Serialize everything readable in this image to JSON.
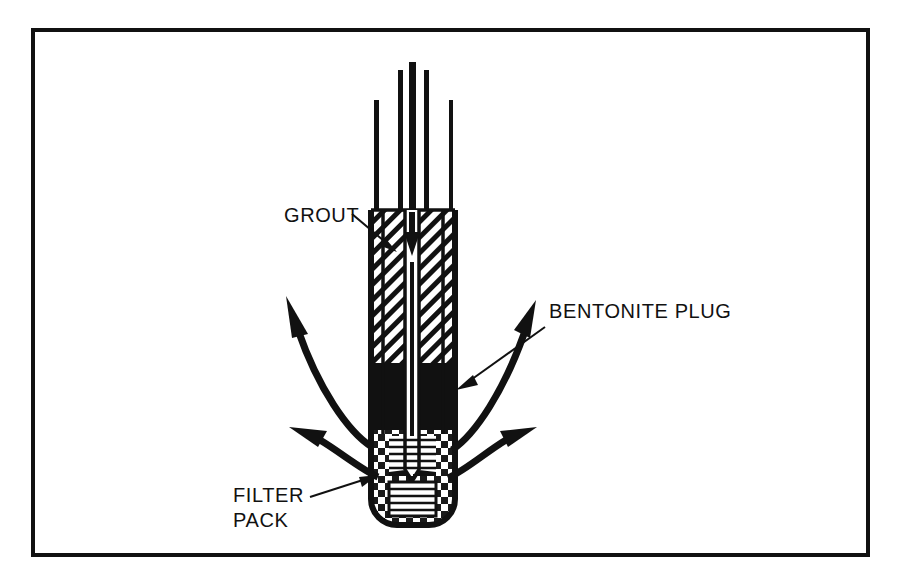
{
  "figure": {
    "type": "technical-cross-section-diagram",
    "background_color": "#ffffff",
    "ink_color": "#111111",
    "frame": {
      "name": "border-frame",
      "x": 33,
      "y": 30,
      "width": 835,
      "height": 525,
      "stroke_width": 4
    }
  },
  "labels": {
    "grout": {
      "text": "GROUT",
      "x": 284,
      "y": 222,
      "anchor": "start",
      "leader_from": [
        352,
        215
      ],
      "leader_to": [
        392,
        248
      ]
    },
    "bentonite": {
      "text": "BENTONITE PLUG",
      "x": 549,
      "y": 318,
      "anchor": "start",
      "leader_from": [
        545,
        327
      ],
      "leader_to": [
        457,
        388
      ]
    },
    "filter_pack_line1": {
      "text": "FILTER",
      "x": 233,
      "y": 502,
      "anchor": "start"
    },
    "filter_pack_line2": {
      "text": "PACK",
      "x": 233,
      "y": 527,
      "anchor": "start",
      "leader_from": [
        310,
        496
      ],
      "leader_to": [
        375,
        477
      ]
    }
  },
  "borehole": {
    "name": "borehole-assembly",
    "casing_left_outer": 371,
    "casing_right_outer": 455,
    "casing_left_inner": 381,
    "casing_right_inner": 445,
    "tube_left": 405,
    "tube_right": 419,
    "top_y": 62,
    "bottom_y": 525,
    "bottom_radius": 26,
    "standpipes": [
      {
        "name": "casing-wall-left",
        "x": 375,
        "top": 100,
        "width": 5
      },
      {
        "name": "riser-left",
        "x": 399,
        "top": 70,
        "width": 5
      },
      {
        "name": "tremie-tube-center",
        "x": 412,
        "top": 62,
        "width": 7
      },
      {
        "name": "riser-right",
        "x": 425,
        "top": 70,
        "width": 5
      },
      {
        "name": "casing-wall-right",
        "x": 450,
        "top": 100,
        "width": 4
      }
    ]
  },
  "zones": [
    {
      "name": "grout-zone",
      "material": "grout",
      "fill_pattern": "diagonal-hatch",
      "top": 210,
      "bottom": 363
    },
    {
      "name": "bentonite-zone",
      "material": "bentonite plug",
      "fill_pattern": "solid-black",
      "top": 363,
      "bottom": 432
    },
    {
      "name": "filter-pack-zone",
      "material": "filter pack",
      "fill_pattern": "checkerboard",
      "top": 432,
      "bottom": 525
    }
  ],
  "well_screen": {
    "name": "well-screen",
    "slot_count": 11,
    "top": 437,
    "bottom": 512
  },
  "flow": {
    "injection_arrow": {
      "name": "grout-injection-arrow",
      "direction": "down",
      "x": 412,
      "from_y": 212,
      "to_y": 252
    },
    "outflow_arrows": [
      {
        "name": "outflow-arrow-upper-left",
        "direction": "up-left"
      },
      {
        "name": "outflow-arrow-lower-left",
        "direction": "left"
      },
      {
        "name": "outflow-arrow-upper-right",
        "direction": "up-right"
      },
      {
        "name": "outflow-arrow-lower-right",
        "direction": "right"
      }
    ]
  }
}
